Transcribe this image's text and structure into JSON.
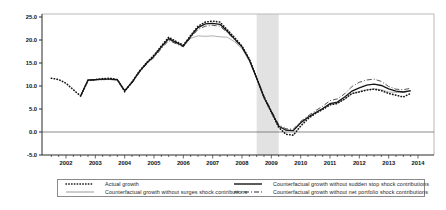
{
  "figure": {
    "background": "#ffffff",
    "axis_color": "#2b2b2b",
    "box_color": "#b8b8b8",
    "zero_line_color": "#5a5a5a",
    "tick_label_color": "#111111"
  },
  "chart_data": {
    "type": "line",
    "title": "",
    "xlabel": "",
    "ylabel": "",
    "ylim": [
      -5,
      25
    ],
    "yticks": [
      25,
      20,
      15,
      10,
      5,
      0,
      -5
    ],
    "ytick_labels": [
      "25.0",
      "20.0",
      "15.0",
      "10.0",
      "5.0",
      "0.0",
      "-5.0"
    ],
    "xtick_labels": [
      "2002",
      "2003",
      "2004",
      "2005",
      "2006",
      "2007",
      "2008",
      "2009",
      "2010",
      "2011",
      "2012",
      "2013",
      "2014"
    ],
    "xticks": [
      2002,
      2003,
      2004,
      2005,
      2006,
      2007,
      2008,
      2009,
      2010,
      2011,
      2012,
      2013,
      2014
    ],
    "x_minor_step": 0.25,
    "x_range": [
      2001.4,
      2014.1
    ],
    "x_start": 2001.5,
    "x_step": 0.25,
    "grid": false,
    "zero_line": 0,
    "legend_position": "bottom",
    "shaded_region": {
      "x_from": 2008.5,
      "x_to": 2009.25,
      "color": "#e2e2e2",
      "name": "crisis-shading"
    },
    "quarters": [
      "2001Q3",
      "2001Q4",
      "2002Q1",
      "2002Q2",
      "2002Q3",
      "2002Q4",
      "2003Q1",
      "2003Q2",
      "2003Q3",
      "2003Q4",
      "2004Q1",
      "2004Q2",
      "2004Q3",
      "2004Q4",
      "2005Q1",
      "2005Q2",
      "2005Q3",
      "2005Q4",
      "2006Q1",
      "2006Q2",
      "2006Q3",
      "2006Q4",
      "2007Q1",
      "2007Q2",
      "2007Q3",
      "2007Q4",
      "2008Q1",
      "2008Q2",
      "2008Q3",
      "2008Q4",
      "2009Q1",
      "2009Q2",
      "2009Q3",
      "2009Q4",
      "2010Q1",
      "2010Q2",
      "2010Q3",
      "2010Q4",
      "2011Q1",
      "2011Q2",
      "2011Q3",
      "2011Q4",
      "2012Q1",
      "2012Q2",
      "2012Q3",
      "2012Q4",
      "2013Q1",
      "2013Q2",
      "2013Q3",
      "2013Q4"
    ],
    "series": [
      {
        "name": "Actual growth",
        "style": "dotted",
        "color": "#151515",
        "values": [
          11.7,
          11.4,
          10.6,
          9.2,
          7.8,
          11.2,
          11.4,
          11.6,
          11.7,
          11.4,
          8.8,
          10.9,
          13.2,
          15.1,
          16.7,
          18.7,
          20.6,
          19.7,
          18.9,
          21.0,
          23.0,
          23.9,
          24.1,
          23.9,
          22.2,
          20.5,
          18.7,
          15.9,
          11.8,
          7.6,
          4.3,
          1.0,
          -0.5,
          -0.7,
          1.3,
          2.9,
          4.0,
          4.9,
          5.9,
          6.2,
          7.2,
          8.4,
          8.7,
          9.1,
          9.3,
          9.0,
          8.4,
          8.0,
          7.6,
          8.4
        ]
      },
      {
        "name": "Counterfactual growth without surges shock contributions",
        "style": "solid-thin",
        "color": "#9a9a9a",
        "values": [
          null,
          null,
          null,
          null,
          7.9,
          11.2,
          11.3,
          11.4,
          11.5,
          11.3,
          9.0,
          10.7,
          13.0,
          14.9,
          16.4,
          18.3,
          20.1,
          19.3,
          18.6,
          20.4,
          20.9,
          20.8,
          20.9,
          20.7,
          20.6,
          19.6,
          18.1,
          15.4,
          11.6,
          7.5,
          4.4,
          1.2,
          0.3,
          0.3,
          2.0,
          3.1,
          4.1,
          5.0,
          6.0,
          6.3,
          7.1,
          8.3,
          8.8,
          9.2,
          9.4,
          9.2,
          8.7,
          8.6,
          8.6,
          8.9
        ]
      },
      {
        "name": "Counterfactual growth without sudden stop shock contributions",
        "style": "solid",
        "color": "#151515",
        "values": [
          null,
          null,
          null,
          null,
          7.9,
          11.3,
          11.4,
          11.5,
          11.5,
          11.4,
          9.0,
          10.8,
          13.1,
          15.0,
          16.5,
          18.5,
          20.3,
          19.5,
          18.7,
          20.8,
          22.7,
          23.5,
          23.6,
          23.4,
          21.9,
          20.2,
          18.5,
          15.7,
          11.7,
          7.5,
          4.4,
          1.3,
          0.4,
          0.3,
          2.0,
          3.2,
          4.2,
          5.1,
          6.2,
          6.5,
          7.6,
          8.9,
          9.6,
          10.2,
          10.4,
          10.1,
          9.4,
          8.9,
          8.7,
          9.0
        ]
      },
      {
        "name": "Counterfactual growth without net portfolio shock contributions",
        "style": "dashdot",
        "color": "#2a2a2a",
        "values": [
          null,
          null,
          null,
          null,
          7.9,
          11.2,
          11.3,
          11.4,
          11.4,
          11.3,
          8.9,
          10.6,
          12.9,
          14.8,
          16.2,
          18.1,
          19.9,
          19.2,
          18.5,
          20.5,
          22.3,
          23.0,
          23.2,
          23.0,
          21.6,
          20.0,
          18.4,
          15.6,
          11.8,
          7.8,
          4.7,
          1.6,
          0.7,
          0.6,
          2.3,
          3.5,
          4.6,
          5.6,
          6.8,
          7.2,
          8.3,
          9.9,
          10.8,
          11.3,
          11.5,
          11.0,
          9.9,
          9.3,
          9.2,
          9.5
        ]
      }
    ]
  },
  "legend": {
    "items": [
      {
        "label": "Actual growth",
        "marker": "dotted"
      },
      {
        "label": "Counterfactual growth without surges shock contributions",
        "marker": "solid-thin"
      },
      {
        "label": "Counterfactual growth without sudden stop shock contributions",
        "marker": "solid"
      },
      {
        "label": "Counterfactual growth without net portfolio shock contributions",
        "marker": "dashdot"
      }
    ]
  }
}
